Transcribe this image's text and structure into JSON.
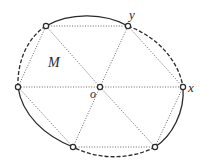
{
  "diagram": {
    "type": "hexagon inscribed in closed convex curve with center",
    "colors": {
      "curve": "#2a2a2a",
      "chord": "#555555",
      "vertex_fill": "#ffffff",
      "vertex_stroke": "#2a2a2a"
    },
    "center": {
      "id": "o",
      "label": "o",
      "x": 100,
      "y": 87
    },
    "vertices": [
      {
        "id": "v1",
        "label": "",
        "x": 46,
        "y": 26
      },
      {
        "id": "y",
        "label": "y",
        "x": 128,
        "y": 26
      },
      {
        "id": "x",
        "label": "x",
        "x": 183,
        "y": 87
      },
      {
        "id": "v4",
        "label": "",
        "x": 155,
        "y": 147
      },
      {
        "id": "v5",
        "label": "",
        "x": 73,
        "y": 147
      },
      {
        "id": "v6",
        "label": "",
        "x": 18,
        "y": 87
      }
    ],
    "region_label": {
      "label": "M",
      "x": 54,
      "y": 64
    },
    "arcs": [
      {
        "from": "v1",
        "to": "y",
        "style": "solid"
      },
      {
        "from": "y",
        "to": "x",
        "style": "dashed"
      },
      {
        "from": "x",
        "to": "v4",
        "style": "solid"
      },
      {
        "from": "v4",
        "to": "v5",
        "style": "dashed"
      },
      {
        "from": "v5",
        "to": "v6",
        "style": "solid"
      },
      {
        "from": "v6",
        "to": "v1",
        "style": "dashed"
      }
    ],
    "chords_dotted": [
      [
        "v1",
        "y"
      ],
      [
        "y",
        "x"
      ],
      [
        "x",
        "v4"
      ],
      [
        "v4",
        "v5"
      ],
      [
        "v5",
        "v6"
      ],
      [
        "v6",
        "v1"
      ],
      [
        "o",
        "v1"
      ],
      [
        "o",
        "y"
      ],
      [
        "o",
        "x"
      ],
      [
        "o",
        "v4"
      ],
      [
        "o",
        "v5"
      ],
      [
        "o",
        "v6"
      ]
    ]
  }
}
